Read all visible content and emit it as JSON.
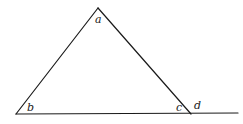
{
  "diagram": {
    "type": "triangle-with-extended-base",
    "colors": {
      "line": "#1a1a1a",
      "label": "#222222",
      "background": "#ffffff"
    },
    "vertices": {
      "apex": {
        "x": 98,
        "y": 8
      },
      "bottom_left": {
        "x": 16,
        "y": 114
      },
      "bottom_right": {
        "x": 191,
        "y": 114
      }
    },
    "baseline_extension_end": {
      "x": 238,
      "y": 113
    },
    "labels": {
      "a": "a",
      "b": "b",
      "c": "c",
      "d": "d"
    }
  }
}
